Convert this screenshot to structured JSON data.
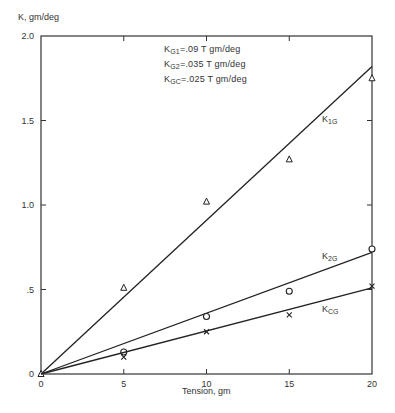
{
  "chart_data": {
    "type": "scatter",
    "title": "",
    "xlabel": "Tension, gm",
    "ylabel": "K, gm/deg",
    "xlim": [
      0,
      20
    ],
    "ylim": [
      0,
      2.0
    ],
    "x_ticks": [
      "0",
      "5",
      "10",
      "15",
      "20"
    ],
    "y_ticks": [
      "0",
      ".5",
      "1.0",
      "1.5",
      "2.0"
    ],
    "grid": false,
    "annotations": [
      {
        "base": "K",
        "sub": "G1",
        "text": "=.09 T gm/deg"
      },
      {
        "base": "K",
        "sub": "G2",
        "text": "=.035 T gm/deg"
      },
      {
        "base": "K",
        "sub": "GC",
        "text": "=.025 T gm/deg"
      }
    ],
    "series": [
      {
        "name": "K1G",
        "label_base": "K",
        "label_sub": "1G",
        "marker": "triangle",
        "x": [
          0,
          5,
          10,
          15,
          20
        ],
        "y": [
          0,
          0.51,
          1.02,
          1.27,
          1.75
        ],
        "fit": {
          "x": [
            0,
            20
          ],
          "y": [
            0,
            1.82
          ]
        }
      },
      {
        "name": "K2G",
        "label_base": "K",
        "label_sub": "2G",
        "marker": "circle",
        "x": [
          5,
          10,
          15,
          20
        ],
        "y": [
          0.13,
          0.34,
          0.49,
          0.74
        ],
        "fit": {
          "x": [
            0,
            20
          ],
          "y": [
            0,
            0.72
          ]
        }
      },
      {
        "name": "KCG",
        "label_base": "K",
        "label_sub": "CG",
        "marker": "x",
        "x": [
          5,
          10,
          15,
          20
        ],
        "y": [
          0.1,
          0.25,
          0.35,
          0.52
        ],
        "fit": {
          "x": [
            0,
            20
          ],
          "y": [
            0,
            0.51
          ]
        }
      }
    ]
  }
}
